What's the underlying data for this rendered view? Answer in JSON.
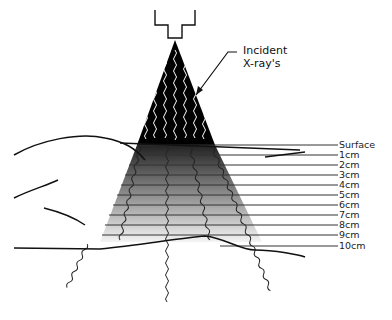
{
  "annotation": {
    "line1": "Incident",
    "line2": "X-ray's"
  },
  "depth_labels": [
    "Surface",
    "1cm",
    "2cm",
    "3cm",
    "4cm",
    "5cm",
    "6cm",
    "7cm",
    "8cm",
    "9cm",
    "10cm"
  ],
  "colors": {
    "beam_top": "#000000",
    "beam_bottom": "#f2f2f2",
    "line": "#222222"
  }
}
